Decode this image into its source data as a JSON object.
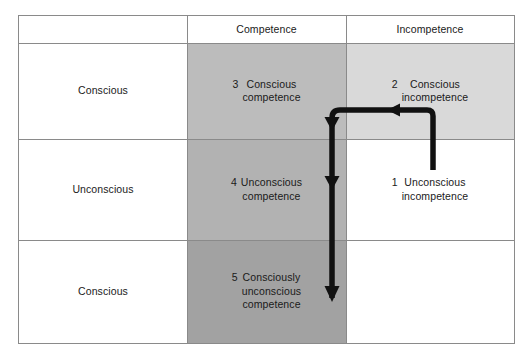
{
  "diagram": {
    "type": "2x3-matrix-with-progression-arrow",
    "columns": [
      {
        "id": "row-label",
        "header": ""
      },
      {
        "id": "competence",
        "header": "Competence"
      },
      {
        "id": "incompetence",
        "header": "Incompetence"
      }
    ],
    "rows": [
      {
        "id": "row-1",
        "label": "Conscious"
      },
      {
        "id": "row-2",
        "label": "Unconscious"
      },
      {
        "id": "row-3",
        "label": "Conscious"
      }
    ],
    "cells": {
      "r1c_competence": {
        "number": "3",
        "text": "Conscious\ncompetence"
      },
      "r1c_incompetence": {
        "number": "2",
        "text": "Conscious\nincompetence"
      },
      "r2c_competence": {
        "number": "4",
        "text": "Unconscious\ncompetence"
      },
      "r2c_incompetence": {
        "number": "1",
        "text": "Unconscious\nincompetence"
      },
      "r3c_competence": {
        "number": "5",
        "text": "Consciously\nunconscious\ncompetence"
      },
      "r3c_incompetence": {
        "number": "",
        "text": ""
      }
    },
    "stages": [
      "1 Unconscious incompetence",
      "2 Conscious incompetence",
      "3 Conscious competence",
      "4 Unconscious competence",
      "5 Consciously unconscious competence"
    ],
    "colors": {
      "border": "#8a8a8a",
      "shade_competence_row1": "#bcbcbc",
      "shade_competence_row2": "#b2b2b2",
      "shade_competence_row3": "#a2a2a2",
      "shade_incompetence_row1": "#d9d9d9",
      "arrow": "#111111",
      "text": "#1a1a1a",
      "background": "#ffffff"
    },
    "arrow": {
      "name": "progression-arrow",
      "description": "Path from stage 1 up, left across to stage 2 column, then down through stages 3, 4 and 5",
      "arrowheads": 4
    }
  }
}
